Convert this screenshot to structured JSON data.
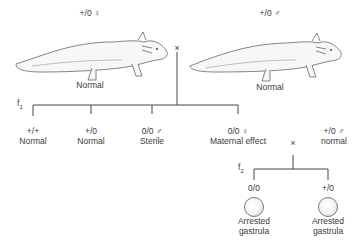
{
  "parents": {
    "female": {
      "genotype": "+/0 ♀",
      "phenotype": "Normal"
    },
    "male": {
      "genotype": "+/0 ♂",
      "phenotype": "Normal"
    },
    "cross_symbol": "×"
  },
  "f1": {
    "label": "f",
    "sub": "1",
    "offspring": [
      {
        "genotype": "+/+",
        "phenotype": "Normal"
      },
      {
        "genotype": "+/0",
        "phenotype": "Normal"
      },
      {
        "genotype": "0/0 ♂",
        "phenotype": "Sterile"
      },
      {
        "genotype": "0/0 ♀",
        "phenotype": "Maternal effect"
      }
    ]
  },
  "cross2": {
    "symbol": "×",
    "mate": {
      "genotype": "+/0 ♂",
      "phenotype": "normal"
    }
  },
  "f2": {
    "label": "f",
    "sub": "2",
    "offspring": [
      {
        "genotype": "0/0",
        "phenotype_line1": "Arrested",
        "phenotype_line2": "gastrula"
      },
      {
        "genotype": "+/0",
        "phenotype_line1": "Arrested",
        "phenotype_line2": "gastrula"
      }
    ]
  }
}
